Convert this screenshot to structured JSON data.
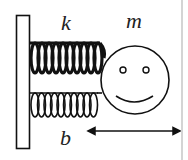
{
  "diagram": {
    "labels": {
      "spring_constant": "k",
      "mass": "m",
      "damping": "b"
    },
    "elements": {
      "wall": {
        "x": 16,
        "y": 15,
        "width": 14,
        "height": 134
      },
      "spring_top": {
        "x_start": 30,
        "x_end": 107,
        "y_top": 41,
        "y_bottom": 75,
        "coils": 10,
        "stroke_width": 3.2
      },
      "spring_bottom": {
        "x_start": 30,
        "x_end": 98,
        "y_top": 92,
        "y_bottom": 118,
        "coils": 10,
        "stroke_width": 1.6
      },
      "mass_circle": {
        "cx": 135,
        "cy": 80,
        "r": 34
      },
      "eyes": [
        {
          "cx": 123,
          "cy": 70,
          "r": 3
        },
        {
          "cx": 146,
          "cy": 70,
          "r": 3
        }
      ],
      "smile": {
        "x_start": 116,
        "x_end": 153,
        "y": 97,
        "depth": 6
      },
      "displacement_arrow": {
        "x_start": 88,
        "x_end": 180,
        "y": 131
      }
    },
    "colors": {
      "stroke": "#111111",
      "background": "#ffffff",
      "edge": "#d4d4d4"
    }
  }
}
